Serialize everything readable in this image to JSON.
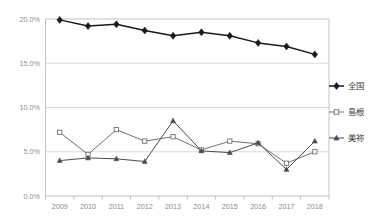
{
  "chart_data": {
    "type": "line",
    "title": "",
    "xlabel": "",
    "ylabel": "",
    "categories": [
      "2009",
      "2010",
      "2011",
      "2012",
      "2013",
      "2014",
      "2015",
      "2016",
      "2017",
      "2018"
    ],
    "ylim": [
      0,
      20
    ],
    "ytick_labels": [
      "0.0%",
      "5.0%",
      "10.0%",
      "15.0%",
      "20.0%"
    ],
    "ytick_values": [
      0,
      5,
      10,
      15,
      20
    ],
    "grid": true,
    "legend_position": "right",
    "series": [
      {
        "name": "全国",
        "marker": "filled-diamond",
        "color": "#1a1a1a",
        "values": [
          19.9,
          19.2,
          19.4,
          18.7,
          18.1,
          18.5,
          18.1,
          17.3,
          16.9,
          16.0
        ]
      },
      {
        "name": "島根",
        "marker": "open-square",
        "color": "#6e6e78",
        "values": [
          7.2,
          4.7,
          7.5,
          6.2,
          6.7,
          5.2,
          6.2,
          5.9,
          3.7,
          5.0
        ]
      },
      {
        "name": "美祢",
        "marker": "filled-triangle",
        "color": "#4a4a52",
        "values": [
          4.0,
          4.3,
          4.2,
          3.9,
          8.5,
          5.1,
          4.9,
          6.0,
          3.0,
          6.2
        ]
      }
    ]
  },
  "legend": {
    "items": [
      {
        "label": "全国"
      },
      {
        "label": "島根"
      },
      {
        "label": "美祢"
      }
    ]
  }
}
